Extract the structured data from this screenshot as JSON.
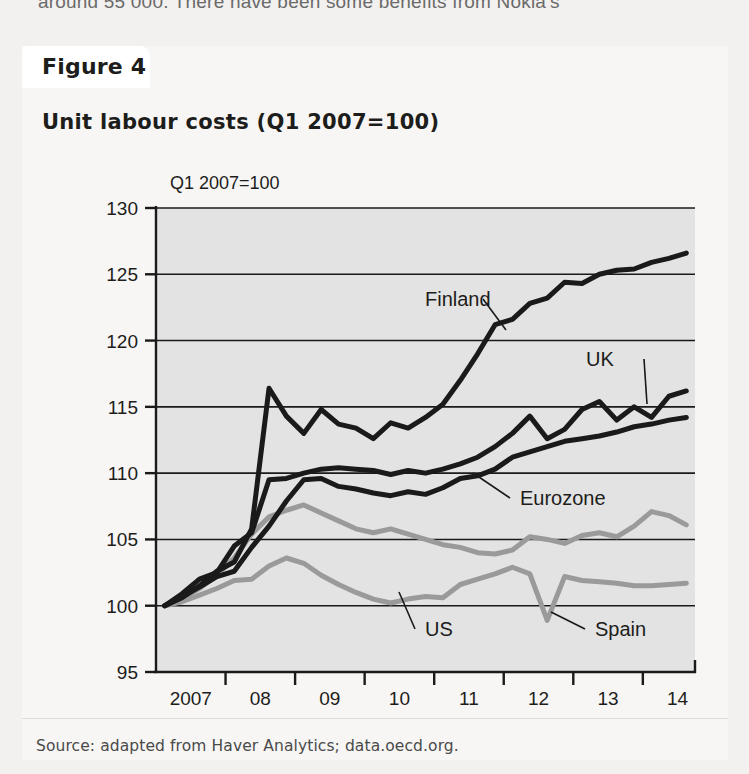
{
  "page_text": "around 55 000. There have been some benefits from Nokia's",
  "figure": {
    "tab_label": "Figure 4",
    "title": "Unit labour costs (Q1 2007=100)",
    "source": "Source: adapted from Haver Analytics; data.oecd.org."
  },
  "chart_data": {
    "type": "line",
    "title": "Unit labour costs (Q1 2007=100)",
    "subtitle": "",
    "unit_note": "Q1 2007=100",
    "xlabel": "",
    "ylabel": "Q1 2007=100",
    "ylim": [
      95,
      130
    ],
    "yticks": [
      95,
      100,
      105,
      110,
      115,
      120,
      125,
      130
    ],
    "ytick_labels": [
      "95",
      "100",
      "105",
      "110",
      "115",
      "120",
      "125",
      "130"
    ],
    "xtick_labels": [
      "2007",
      "08",
      "09",
      "10",
      "11",
      "12",
      "13",
      "14"
    ],
    "xlim": [
      2006.875,
      2014.625
    ],
    "x_frequency": "quarterly",
    "grid": true,
    "grid_axis": "y",
    "legend": "inline-annotations",
    "plot_background": "#e3e3e3",
    "colors": {
      "dark": "#1a1a1a",
      "gray": "#9a9a9a"
    },
    "x": [
      2007.0,
      2007.25,
      2007.5,
      2007.75,
      2008.0,
      2008.25,
      2008.5,
      2008.75,
      2009.0,
      2009.25,
      2009.5,
      2009.75,
      2010.0,
      2010.25,
      2010.5,
      2010.75,
      2011.0,
      2011.25,
      2011.5,
      2011.75,
      2012.0,
      2012.25,
      2012.5,
      2012.75,
      2013.0,
      2013.25,
      2013.5,
      2013.75,
      2014.0,
      2014.25,
      2014.5
    ],
    "series": [
      {
        "name": "Finland",
        "color": "#1a1a1a",
        "style": "solid",
        "label_text": "Finland",
        "values": [
          100.0,
          100.6,
          101.5,
          102.6,
          103.3,
          105.8,
          116.4,
          114.3,
          113.0,
          114.8,
          113.7,
          113.4,
          112.6,
          113.8,
          113.4,
          114.2,
          115.2,
          117.0,
          119.0,
          121.2,
          121.6,
          122.8,
          123.2,
          124.4,
          124.3,
          125.0,
          125.3,
          125.4,
          125.9,
          126.2,
          126.6
        ]
      },
      {
        "name": "UK",
        "color": "#1a1a1a",
        "style": "solid",
        "label_text": "UK",
        "values": [
          100.0,
          100.9,
          102.0,
          102.5,
          104.5,
          105.5,
          109.5,
          109.6,
          110.0,
          110.3,
          110.4,
          110.3,
          110.2,
          109.9,
          110.2,
          110.0,
          110.3,
          110.7,
          111.2,
          112.0,
          113.0,
          114.3,
          112.6,
          113.3,
          114.8,
          115.4,
          114.0,
          115.0,
          114.2,
          115.8,
          116.2
        ]
      },
      {
        "name": "Eurozone",
        "color": "#1a1a1a",
        "style": "solid",
        "label_text": "Eurozone",
        "values": [
          100.0,
          100.7,
          101.4,
          102.2,
          102.6,
          104.4,
          106.0,
          107.9,
          109.5,
          109.6,
          109.0,
          108.8,
          108.5,
          108.3,
          108.6,
          108.4,
          108.9,
          109.6,
          109.8,
          110.3,
          111.2,
          111.6,
          112.0,
          112.4,
          112.6,
          112.8,
          113.1,
          113.5,
          113.7,
          114.0,
          114.2
        ]
      },
      {
        "name": "US",
        "color": "#9a9a9a",
        "style": "solid",
        "label_text": "US",
        "values": [
          100.0,
          100.5,
          101.3,
          102.3,
          103.6,
          105.4,
          106.7,
          107.2,
          107.6,
          107.0,
          106.4,
          105.8,
          105.5,
          105.8,
          105.4,
          105.0,
          104.6,
          104.4,
          104.0,
          103.9,
          104.2,
          105.2,
          105.0,
          104.7,
          105.3,
          105.5,
          105.2,
          106.0,
          107.1,
          106.8,
          106.1
        ]
      },
      {
        "name": "Spain",
        "color": "#9a9a9a",
        "style": "solid",
        "label_text": "Spain",
        "values": [
          100.0,
          100.3,
          100.8,
          101.3,
          101.9,
          102.0,
          103.0,
          103.6,
          103.2,
          102.3,
          101.6,
          101.0,
          100.5,
          100.2,
          100.5,
          100.7,
          100.6,
          101.6,
          102.0,
          102.4,
          102.9,
          102.4,
          98.9,
          102.2,
          101.9,
          101.8,
          101.7,
          101.5,
          101.5,
          101.6,
          101.7
        ]
      }
    ],
    "annotations": [
      {
        "text": "Finland",
        "label_x": 425,
        "label_y": 306,
        "leader_to_x": 506,
        "leader_to_y": 330
      },
      {
        "text": "UK",
        "label_x": 586,
        "label_y": 366,
        "leader_to_x": 647,
        "leader_to_y": 404
      },
      {
        "text": "Eurozone",
        "label_x": 520,
        "label_y": 505,
        "leader_to_x": 473,
        "leader_to_y": 473
      },
      {
        "text": "US",
        "label_x": 425,
        "label_y": 636,
        "leader_to_x": 399,
        "leader_to_y": 592
      },
      {
        "text": "Spain",
        "label_x": 595,
        "label_y": 636,
        "leader_to_x": 551,
        "leader_to_y": 612
      }
    ]
  }
}
